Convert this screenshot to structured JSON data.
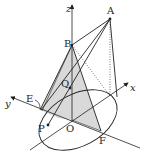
{
  "diagram": {
    "type": "3d-geometry-cone",
    "colors": {
      "stroke": "#222222",
      "shade": "#d9d9d9",
      "background": "#ffffff"
    },
    "axes": {
      "x": {
        "label": "x"
      },
      "y": {
        "label": "y"
      },
      "z": {
        "label": "z"
      }
    },
    "points": {
      "A": {
        "label": "A"
      },
      "B": {
        "label": "B"
      },
      "O": {
        "label": "O"
      },
      "P": {
        "label": "P"
      },
      "Q": {
        "label": "Q"
      },
      "E": {
        "label": "E"
      },
      "F": {
        "label": "F"
      }
    }
  }
}
